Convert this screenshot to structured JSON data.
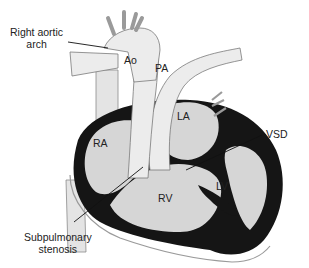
{
  "figure": {
    "type": "anatomical-diagram",
    "colors": {
      "chamber_fill": "#d6d6d6",
      "vessel_fill": "#e9e9e9",
      "wall": "#151515",
      "outline": "#7a7a7a",
      "text": "#222222",
      "background": "#ffffff"
    }
  },
  "labels": {
    "right_aortic_arch_line1": "Right aortic",
    "right_aortic_arch_line2": "arch",
    "ao": "Ao",
    "pa": "PA",
    "la": "LA",
    "ra": "RA",
    "vsd": "VSD",
    "rv": "RV",
    "lv": "LV",
    "subpulmonary_line1": "Subpulmonary",
    "subpulmonary_line2": "stenosis"
  }
}
